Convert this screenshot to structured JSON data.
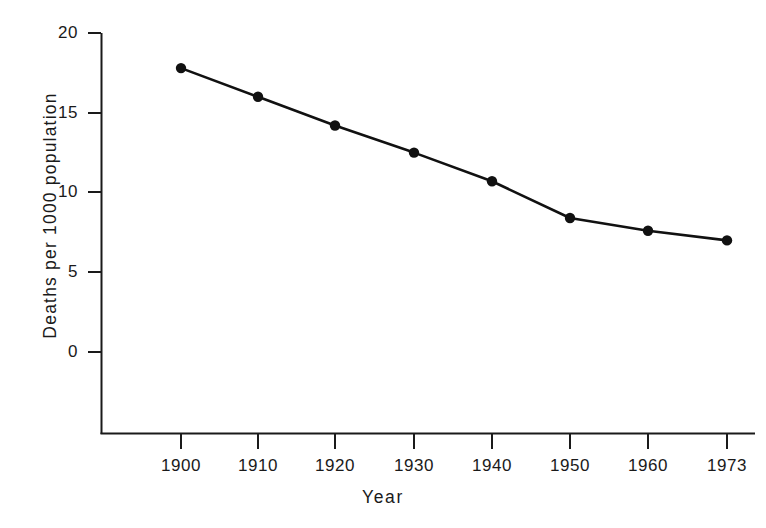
{
  "chart_data": {
    "type": "line",
    "title": "",
    "xlabel": "Year",
    "ylabel": "Deaths per 1000 population",
    "categories": [
      "1900",
      "1910",
      "1920",
      "1930",
      "1940",
      "1950",
      "1960",
      "1973"
    ],
    "x": [
      1900,
      1910,
      1920,
      1930,
      1940,
      1950,
      1960,
      1973
    ],
    "values": [
      17.8,
      16.0,
      14.2,
      12.5,
      10.7,
      8.4,
      7.6,
      7.0
    ],
    "series": [
      {
        "name": "Death rate",
        "values": [
          17.8,
          16.0,
          14.2,
          12.5,
          10.7,
          8.4,
          7.6,
          7.0
        ]
      }
    ],
    "ylim": [
      0,
      20
    ],
    "ytick_labels": [
      "0",
      "5",
      "10",
      "15",
      "20"
    ],
    "ytick_values": [
      0,
      5,
      10,
      15,
      20
    ],
    "xtick_labels": [
      "1900",
      "1910",
      "1920",
      "1930",
      "1940",
      "1950",
      "1960",
      "1973"
    ],
    "grid": false,
    "legend": false,
    "marker": "filled-circle",
    "line_color": "#111111",
    "marker_color": "#111111",
    "axis_color": "#1a1a1a",
    "background_color": "#ffffff"
  }
}
